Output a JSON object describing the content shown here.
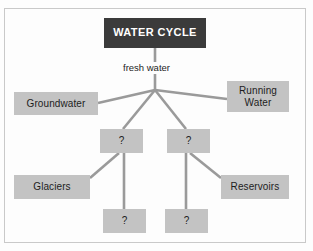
{
  "diagram": {
    "type": "hierarchy-tree",
    "title": "WATER CYCLE",
    "edge_labels": {
      "root_to_hub": "fresh water"
    },
    "colors": {
      "title_fill": "#3b3b3b",
      "title_text": "#ffffff",
      "node_fill": "#c3c3c3",
      "node_text": "#1d1d1d",
      "connector": "#9a9a9a",
      "frame_border": "#c9c9c9",
      "background": "#fdfdfd"
    },
    "nodes": [
      {
        "id": "root",
        "label": "WATER CYCLE",
        "level": 0
      },
      {
        "id": "groundwater",
        "label": "Groundwater",
        "level": 1
      },
      {
        "id": "running",
        "label": "Running\nWater",
        "line1": "Running",
        "line2": "Water",
        "level": 1
      },
      {
        "id": "mid-left",
        "label": "?",
        "level": 1
      },
      {
        "id": "mid-right",
        "label": "?",
        "level": 1
      },
      {
        "id": "glaciers",
        "label": "Glaciers",
        "level": 2
      },
      {
        "id": "reservoirs",
        "label": "Reservoirs",
        "level": 2
      },
      {
        "id": "low-left",
        "label": "?",
        "level": 2
      },
      {
        "id": "low-right",
        "label": "?",
        "level": 2
      }
    ],
    "edges": [
      {
        "from": "root",
        "to": "hub",
        "label": "fresh water"
      },
      {
        "from": "hub",
        "to": "groundwater",
        "label": ""
      },
      {
        "from": "hub",
        "to": "running",
        "label": ""
      },
      {
        "from": "hub",
        "to": "mid-left",
        "label": ""
      },
      {
        "from": "hub",
        "to": "mid-right",
        "label": ""
      },
      {
        "from": "mid-left",
        "to": "glaciers",
        "label": ""
      },
      {
        "from": "mid-left",
        "to": "low-left",
        "label": ""
      },
      {
        "from": "mid-right",
        "to": "reservoirs",
        "label": ""
      },
      {
        "from": "mid-right",
        "to": "low-right",
        "label": ""
      }
    ]
  }
}
